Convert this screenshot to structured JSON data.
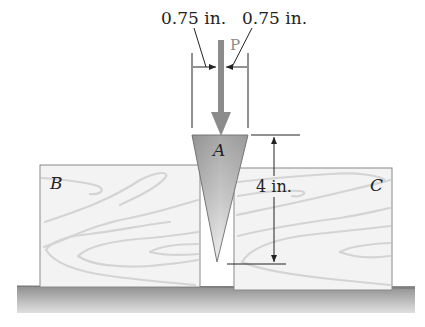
{
  "figure": {
    "load": {
      "label": "P",
      "color": "#8a8a8a"
    },
    "dimensions": {
      "half_width_left": "0.75 in.",
      "half_width_right": "0.75 in.",
      "height": "4 in."
    },
    "parts": {
      "wedge": {
        "label": "A"
      },
      "block_left": {
        "label": "B"
      },
      "block_right": {
        "label": "C"
      }
    },
    "colors": {
      "wedge_dark": "#9a9a9a",
      "wedge_light": "#e2e2e2",
      "block_fill": "#f2f2f2",
      "grain": "#d6d6d6",
      "ground_top": "#8c8c8c",
      "ground_bottom": "#dcdcdc",
      "line": "#222222"
    }
  }
}
